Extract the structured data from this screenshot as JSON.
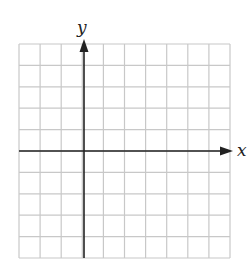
{
  "diagram": {
    "type": "coordinate-grid",
    "x_label": "x",
    "y_label": "y",
    "columns": 10,
    "rows": 10,
    "y_axis_column": 3,
    "x_axis_row": 5,
    "grid_color": "#c8c8c8",
    "axis_color": "#222222"
  },
  "chart_data": {
    "type": "scatter",
    "title": "",
    "xlabel": "x",
    "ylabel": "y",
    "xlim": [
      -3,
      7
    ],
    "ylim": [
      -5,
      5
    ],
    "grid": true,
    "series": []
  }
}
